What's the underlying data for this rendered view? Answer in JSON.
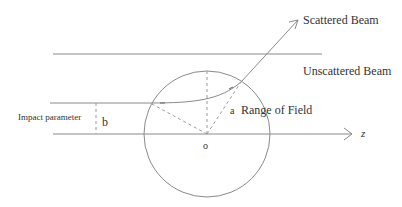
{
  "diagram": {
    "labels": {
      "scattered_beam": "Scattered Beam",
      "unscattered_beam": "Unscattered Beam",
      "impact_parameter": "Impact parameter",
      "b": "b",
      "a": "a",
      "range_of_field": "Range of Field",
      "origin": "o",
      "z_axis": "z"
    },
    "colors": {
      "line": "#8a8a8a",
      "dashed": "#9a9a9a",
      "text": "#333333",
      "background": "#ffffff"
    },
    "geometry": {
      "circle_center": [
        207,
        134
      ],
      "circle_radius": 63,
      "top_line_y": 54,
      "beam_y": 103,
      "axis_y": 134
    }
  }
}
